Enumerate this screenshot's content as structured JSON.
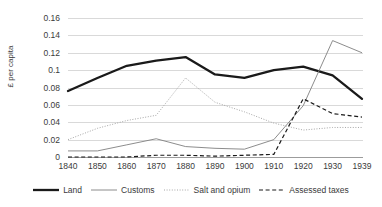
{
  "chart_data": {
    "type": "line",
    "title": "",
    "xlabel": "",
    "ylabel": "£ per capita",
    "categories": [
      "1840",
      "1850",
      "1860",
      "1870",
      "1880",
      "1890",
      "1900",
      "1910",
      "1920",
      "1930",
      "1939"
    ],
    "ylim": [
      0,
      0.16
    ],
    "yticks": [
      "0",
      "0.02",
      "0.04",
      "0.06",
      "0.08",
      "0.1",
      "0.12",
      "0.14",
      "0.16"
    ],
    "ytick_values": [
      0,
      0.02,
      0.04,
      0.06,
      0.08,
      0.1,
      0.12,
      0.14,
      0.16
    ],
    "grid": true,
    "legend_position": "bottom",
    "series": [
      {
        "name": "Land",
        "style": "solid-thick",
        "color": "#1a1a1a",
        "values": [
          0.076,
          0.091,
          0.105,
          0.111,
          0.115,
          0.095,
          0.091,
          0.1,
          0.104,
          0.094,
          0.067
        ]
      },
      {
        "name": "Customs",
        "style": "solid-thin",
        "color": "#7f7f7f",
        "values": [
          0.007,
          0.007,
          0.014,
          0.021,
          0.012,
          0.01,
          0.009,
          0.02,
          0.059,
          0.134,
          0.12
        ]
      },
      {
        "name": "Salt and opium",
        "style": "dotted",
        "color": "#a6a6a6",
        "values": [
          0.02,
          0.033,
          0.042,
          0.048,
          0.091,
          0.063,
          0.052,
          0.039,
          0.031,
          0.034,
          0.034
        ]
      },
      {
        "name": "Assessed taxes",
        "style": "dashed",
        "color": "#1a1a1a",
        "values": [
          0.0,
          0.0,
          0.0,
          0.002,
          0.002,
          0.001,
          0.002,
          0.003,
          0.067,
          0.05,
          0.046
        ]
      }
    ]
  },
  "legend": {
    "items": [
      {
        "label": "Land",
        "style": "solid-thick"
      },
      {
        "label": "Customs",
        "style": "solid-thin"
      },
      {
        "label": "Salt and opium",
        "style": "dotted"
      },
      {
        "label": "Assessed taxes",
        "style": "dashed"
      }
    ]
  }
}
